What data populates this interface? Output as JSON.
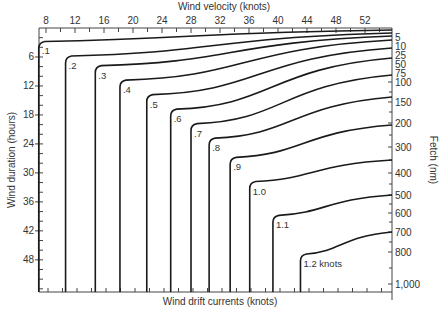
{
  "chart_data": {
    "type": "line",
    "title": "",
    "top_axis": {
      "label": "Wind velocity (knots)",
      "ticks": [
        8,
        12,
        16,
        20,
        24,
        28,
        32,
        36,
        40,
        44,
        48,
        52
      ],
      "range": [
        7,
        55
      ]
    },
    "left_axis": {
      "label": "Wind duration (hours)",
      "ticks": [
        6,
        12,
        18,
        24,
        30,
        36,
        42,
        48
      ],
      "range": [
        0,
        54
      ]
    },
    "right_axis": {
      "label": "Fetch (nm)",
      "ticks": [
        "5",
        "10",
        "25",
        "50",
        "75",
        "100",
        "150",
        "200",
        "300",
        "400",
        "500",
        "600",
        "700",
        "800",
        "1,000"
      ]
    },
    "bottom_axis": {
      "label": "Wind drift currents (knots)"
    },
    "series": [
      {
        "name": ".1",
        "label": ".1",
        "current_knots": 0.1,
        "vertical_wind_knots": 7.0,
        "corner_duration_hours": 3,
        "end_fetch_nm": 2
      },
      {
        "name": ".2",
        "label": ".2",
        "current_knots": 0.2,
        "vertical_wind_knots": 10.7,
        "corner_duration_hours": 6,
        "end_fetch_nm": 3
      },
      {
        "name": ".3",
        "label": ".3",
        "current_knots": 0.3,
        "vertical_wind_knots": 14.8,
        "corner_duration_hours": 8,
        "end_fetch_nm": 4
      },
      {
        "name": ".4",
        "label": ".4",
        "current_knots": 0.4,
        "vertical_wind_knots": 18.2,
        "corner_duration_hours": 11,
        "end_fetch_nm": 7
      },
      {
        "name": ".5",
        "label": ".5",
        "current_knots": 0.5,
        "vertical_wind_knots": 21.9,
        "corner_duration_hours": 14,
        "end_fetch_nm": 25
      },
      {
        "name": ".6",
        "label": ".6",
        "current_knots": 0.6,
        "vertical_wind_knots": 25.2,
        "corner_duration_hours": 17,
        "end_fetch_nm": 50
      },
      {
        "name": ".7",
        "label": ".7",
        "current_knots": 0.7,
        "vertical_wind_knots": 28.0,
        "corner_duration_hours": 20,
        "end_fetch_nm": 100
      },
      {
        "name": ".8",
        "label": ".8",
        "current_knots": 0.8,
        "vertical_wind_knots": 30.5,
        "corner_duration_hours": 23,
        "end_fetch_nm": 170
      },
      {
        "name": ".9",
        "label": ".9",
        "current_knots": 0.9,
        "vertical_wind_knots": 33.4,
        "corner_duration_hours": 27,
        "end_fetch_nm": 300
      },
      {
        "name": "1.0",
        "label": "1.0",
        "current_knots": 1.0,
        "vertical_wind_knots": 36.1,
        "corner_duration_hours": 32,
        "end_fetch_nm": 500
      },
      {
        "name": "1.1",
        "label": "1.1",
        "current_knots": 1.1,
        "vertical_wind_knots": 39.3,
        "corner_duration_hours": 39,
        "end_fetch_nm": 700
      },
      {
        "name": "1.2",
        "label": "1.2 knots",
        "current_knots": 1.2,
        "vertical_wind_knots": 43.1,
        "corner_duration_hours": 47,
        "end_fetch_nm": 600
      }
    ],
    "grid": false,
    "legend": "none (curves labeled inline)"
  }
}
